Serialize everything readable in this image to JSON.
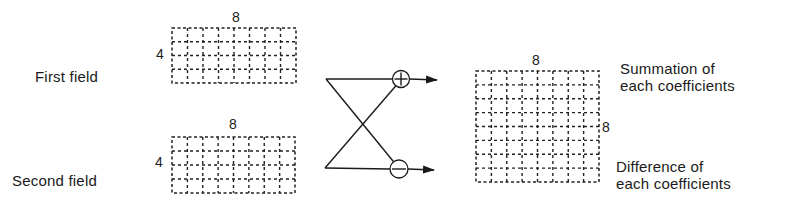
{
  "labels": {
    "first_field": "First field",
    "second_field": "Second field",
    "summation_line1": "Summation of",
    "summation_line2": "each coefficients",
    "difference_line1": "Difference of",
    "difference_line2": "each coefficients"
  },
  "blocks": {
    "first_field": {
      "cols": 8,
      "rows": 4,
      "width_label": "8",
      "height_label": "4",
      "x": 172,
      "y": 28,
      "w": 124,
      "h": 55
    },
    "second_field": {
      "cols": 8,
      "rows": 4,
      "width_label": "8",
      "height_label": "4",
      "x": 172,
      "y": 137,
      "w": 123,
      "h": 56
    },
    "output": {
      "cols": 8,
      "rows": 8,
      "width_label": "8",
      "height_label": "8",
      "x": 476,
      "y": 71,
      "w": 123,
      "h": 111
    }
  },
  "operators": {
    "sum": {
      "symbol": "+",
      "cx": 401,
      "cy": 79,
      "r": 8.5
    },
    "difference": {
      "symbol": "−",
      "cx": 399,
      "cy": 169,
      "r": 9
    }
  },
  "butterfly": {
    "top_left": [
      326,
      79
    ],
    "bottom_left": [
      325,
      168
    ],
    "arrow_top_tip": [
      437,
      80
    ],
    "arrow_bottom_tip": [
      434,
      170
    ]
  },
  "colors": {
    "ink": "#1a1a1a",
    "background": "#ffffff"
  }
}
